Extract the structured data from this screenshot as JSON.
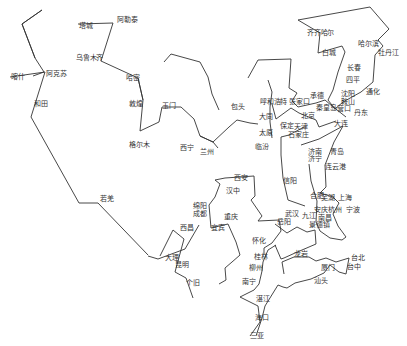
{
  "map": {
    "width": 407,
    "height": 346,
    "line_color": "#333333",
    "label_color": "#333333",
    "routes": [
      {
        "name": "xinjiang-west",
        "points": [
          [
            33,
            76
          ],
          [
            44,
            72
          ],
          [
            35,
            58
          ],
          [
            22,
            24
          ],
          [
            42,
            10
          ],
          [
            22,
            24
          ],
          [
            35,
            58
          ]
        ]
      },
      {
        "name": "tacheng-altay-urumqi",
        "points": [
          [
            78,
            24
          ],
          [
            113,
            23
          ],
          [
            101,
            61
          ],
          [
            138,
            78
          ],
          [
            143,
            100
          ]
        ]
      },
      {
        "name": "kashgar-hotan-lhasa",
        "points": [
          [
            10,
            77
          ],
          [
            45,
            72
          ],
          [
            31,
            117
          ],
          [
            79,
            203
          ],
          [
            98,
            203
          ],
          [
            148,
            255
          ]
        ]
      },
      {
        "name": "hami-golmud-xining",
        "points": [
          [
            138,
            78
          ],
          [
            143,
            100
          ],
          [
            140,
            131
          ],
          [
            159,
            122
          ],
          [
            162,
            107
          ],
          [
            181,
            107
          ],
          [
            194,
            119
          ],
          [
            200,
            136
          ],
          [
            213,
            142
          ],
          [
            229,
            127
          ],
          [
            237,
            120
          ],
          [
            250,
            123
          ],
          [
            258,
            124
          ]
        ]
      },
      {
        "name": "qinghai-gansu",
        "points": [
          [
            164,
            62
          ],
          [
            171,
            54
          ],
          [
            200,
            62
          ],
          [
            208,
            77
          ],
          [
            212,
            94
          ],
          [
            219,
            110
          ]
        ]
      },
      {
        "name": "northeast-loop",
        "points": [
          [
            298,
            20
          ],
          [
            370,
            7
          ],
          [
            389,
            29
          ],
          [
            378,
            40
          ],
          [
            383,
            46
          ],
          [
            375,
            55
          ],
          [
            373,
            82
          ],
          [
            361,
            92
          ],
          [
            343,
            102
          ],
          [
            335,
            109
          ],
          [
            328,
            100
          ],
          [
            333,
            90
          ],
          [
            338,
            72
          ],
          [
            345,
            52
          ],
          [
            342,
            46
          ],
          [
            318,
            53
          ],
          [
            320,
            33
          ],
          [
            298,
            20
          ]
        ]
      },
      {
        "name": "hohhot-north-china",
        "points": [
          [
            248,
            78
          ],
          [
            258,
            60
          ],
          [
            291,
            59
          ],
          [
            289,
            88
          ],
          [
            297,
            93
          ],
          [
            292,
            101
          ],
          [
            298,
            107
          ],
          [
            316,
            103
          ],
          [
            325,
            100
          ],
          [
            332,
            106
          ],
          [
            346,
            117
          ]
        ]
      },
      {
        "name": "beijing-tianjin-coast",
        "points": [
          [
            272,
            104
          ],
          [
            276,
            119
          ],
          [
            291,
            108
          ],
          [
            299,
            113
          ],
          [
            316,
            120
          ],
          [
            319,
            127
          ],
          [
            336,
            121
          ]
        ]
      },
      {
        "name": "datong-taiyuan",
        "points": [
          [
            268,
            80
          ],
          [
            272,
            92
          ],
          [
            270,
            107
          ],
          [
            270,
            122
          ],
          [
            272,
            138
          ]
        ]
      },
      {
        "name": "shijiazhuang-xinyang",
        "points": [
          [
            304,
            127
          ],
          [
            289,
            135
          ],
          [
            281,
            137
          ],
          [
            281,
            155
          ],
          [
            283,
            178
          ],
          [
            288,
            200
          ],
          [
            305,
            206
          ]
        ]
      },
      {
        "name": "shandong-loop",
        "points": [
          [
            301,
            145
          ],
          [
            319,
            139
          ],
          [
            343,
            126
          ],
          [
            334,
            142
          ],
          [
            325,
            165
          ],
          [
            326,
            187
          ],
          [
            320,
            193
          ],
          [
            333,
            197
          ],
          [
            339,
            203
          ],
          [
            333,
            214
          ],
          [
            338,
            226
          ],
          [
            346,
            237
          ],
          [
            342,
            240
          ],
          [
            330,
            238
          ],
          [
            320,
            231
          ],
          [
            316,
            222
          ],
          [
            317,
            201
          ],
          [
            311,
            181
          ],
          [
            309,
            164
          ]
        ]
      },
      {
        "name": "xian-chengdu-yibin",
        "points": [
          [
            215,
            180
          ],
          [
            225,
            178
          ],
          [
            254,
            176
          ],
          [
            255,
            196
          ],
          [
            251,
            200
          ],
          [
            262,
            216
          ],
          [
            258,
            221
          ],
          [
            279,
            220
          ],
          [
            281,
            231
          ],
          [
            272,
            243
          ],
          [
            264,
            248
          ],
          [
            264,
            255
          ]
        ]
      },
      {
        "name": "hanzhong-chengdu",
        "points": [
          [
            215,
            180
          ],
          [
            220,
            184
          ],
          [
            215,
            197
          ],
          [
            209,
            205
          ],
          [
            211,
            228
          ],
          [
            228,
            224
          ],
          [
            236,
            242
          ],
          [
            240,
            255
          ],
          [
            232,
            262
          ],
          [
            225,
            268
          ],
          [
            226,
            280
          ],
          [
            219,
            284
          ]
        ]
      },
      {
        "name": "lanzhou-xian",
        "points": [
          [
            200,
            136
          ],
          [
            213,
            142
          ],
          [
            218,
            148
          ]
        ]
      },
      {
        "name": "chengdu-kunming",
        "points": [
          [
            199,
            225
          ],
          [
            185,
            249
          ],
          [
            158,
            259
          ],
          [
            148,
            256
          ]
        ]
      },
      {
        "name": "kunming-gejiu",
        "points": [
          [
            160,
            256
          ],
          [
            173,
            230
          ],
          [
            184,
            239
          ],
          [
            175,
            272
          ],
          [
            186,
            278
          ],
          [
            193,
            298
          ]
        ]
      },
      {
        "name": "huaihua-nanning",
        "points": [
          [
            276,
            245
          ],
          [
            268,
            250
          ],
          [
            263,
            262
          ],
          [
            262,
            271
          ],
          [
            259,
            284
          ],
          [
            254,
            290
          ],
          [
            240,
            297
          ],
          [
            258,
            306
          ],
          [
            260,
            322
          ],
          [
            250,
            336
          ]
        ]
      },
      {
        "name": "south-coast",
        "points": [
          [
            284,
            274
          ],
          [
            282,
            262
          ],
          [
            294,
            257
          ],
          [
            309,
            257
          ],
          [
            316,
            261
          ],
          [
            326,
            258
          ],
          [
            336,
            262
          ],
          [
            349,
            258
          ],
          [
            346,
            274
          ],
          [
            339,
            272
          ],
          [
            330,
            265
          ],
          [
            324,
            273
          ],
          [
            311,
            279
          ],
          [
            295,
            283
          ],
          [
            287,
            288
          ],
          [
            283,
            287
          ],
          [
            278,
            285
          ],
          [
            265,
            306
          ],
          [
            262,
            318
          ],
          [
            256,
            336
          ]
        ]
      },
      {
        "name": "hubei-jiangxi",
        "points": [
          [
            275,
            224
          ],
          [
            287,
            233
          ],
          [
            297,
            227
          ],
          [
            307,
            232
          ],
          [
            315,
            230
          ],
          [
            316,
            244
          ],
          [
            295,
            253
          ],
          [
            284,
            258
          ],
          [
            281,
            259
          ],
          [
            275,
            245
          ]
        ]
      }
    ],
    "labels": [
      {
        "text": "阿勒泰",
        "x": 117,
        "y": 20
      },
      {
        "text": "塔城",
        "x": 79,
        "y": 26
      },
      {
        "text": "乌鲁木齐",
        "x": 76,
        "y": 58
      },
      {
        "text": "哈密",
        "x": 126,
        "y": 78
      },
      {
        "text": "阿克苏",
        "x": 46,
        "y": 74
      },
      {
        "text": "喀什",
        "x": 11,
        "y": 77
      },
      {
        "text": "和田",
        "x": 34,
        "y": 104
      },
      {
        "text": "敦煌",
        "x": 129,
        "y": 104
      },
      {
        "text": "玉门",
        "x": 162,
        "y": 106
      },
      {
        "text": "格尔木",
        "x": 129,
        "y": 145
      },
      {
        "text": "西宁",
        "x": 180,
        "y": 148
      },
      {
        "text": "兰州",
        "x": 200,
        "y": 152
      },
      {
        "text": "若羌",
        "x": 100,
        "y": 199
      },
      {
        "text": "齐齐哈尔",
        "x": 307,
        "y": 33
      },
      {
        "text": "哈尔滨",
        "x": 358,
        "y": 44
      },
      {
        "text": "白城",
        "x": 322,
        "y": 53
      },
      {
        "text": "牡丹江",
        "x": 378,
        "y": 53
      },
      {
        "text": "长春",
        "x": 347,
        "y": 68
      },
      {
        "text": "四平",
        "x": 346,
        "y": 80
      },
      {
        "text": "通化",
        "x": 366,
        "y": 92
      },
      {
        "text": "包头",
        "x": 231,
        "y": 107
      },
      {
        "text": "呼和浩特",
        "x": 260,
        "y": 102
      },
      {
        "text": "张家口",
        "x": 289,
        "y": 102
      },
      {
        "text": "承德",
        "x": 310,
        "y": 96
      },
      {
        "text": "沈阳",
        "x": 341,
        "y": 94
      },
      {
        "text": "鞍山",
        "x": 341,
        "y": 102
      },
      {
        "text": "营口",
        "x": 337,
        "y": 109
      },
      {
        "text": "丹东",
        "x": 354,
        "y": 113
      },
      {
        "text": "秦皇岛",
        "x": 316,
        "y": 108
      },
      {
        "text": "大同",
        "x": 259,
        "y": 117
      },
      {
        "text": "北京",
        "x": 301,
        "y": 116
      },
      {
        "text": "大连",
        "x": 334,
        "y": 124
      },
      {
        "text": "保定",
        "x": 280,
        "y": 126
      },
      {
        "text": "天津",
        "x": 294,
        "y": 127
      },
      {
        "text": "太原",
        "x": 259,
        "y": 133
      },
      {
        "text": "石家庄",
        "x": 288,
        "y": 135
      },
      {
        "text": "临汾",
        "x": 255,
        "y": 147
      },
      {
        "text": "济南",
        "x": 308,
        "y": 152
      },
      {
        "text": "济宁",
        "x": 308,
        "y": 159
      },
      {
        "text": "青岛",
        "x": 330,
        "y": 152
      },
      {
        "text": "连云港",
        "x": 325,
        "y": 167
      },
      {
        "text": "西安",
        "x": 234,
        "y": 178
      },
      {
        "text": "信阳",
        "x": 283,
        "y": 181
      },
      {
        "text": "汉中",
        "x": 226,
        "y": 191
      },
      {
        "text": "合肥",
        "x": 310,
        "y": 196
      },
      {
        "text": "芜湖",
        "x": 321,
        "y": 198
      },
      {
        "text": "上海",
        "x": 338,
        "y": 198
      },
      {
        "text": "绵阳",
        "x": 193,
        "y": 206
      },
      {
        "text": "安庆",
        "x": 314,
        "y": 210
      },
      {
        "text": "杭州",
        "x": 328,
        "y": 210
      },
      {
        "text": "宁波",
        "x": 346,
        "y": 210
      },
      {
        "text": "成都",
        "x": 193,
        "y": 214
      },
      {
        "text": "武汉",
        "x": 285,
        "y": 214
      },
      {
        "text": "九江",
        "x": 302,
        "y": 216
      },
      {
        "text": "南昌",
        "x": 318,
        "y": 218
      },
      {
        "text": "重庆",
        "x": 224,
        "y": 217
      },
      {
        "text": "岳阳",
        "x": 277,
        "y": 222
      },
      {
        "text": "景德镇",
        "x": 309,
        "y": 225
      },
      {
        "text": "宜宾",
        "x": 211,
        "y": 228
      },
      {
        "text": "西昌",
        "x": 180,
        "y": 228
      },
      {
        "text": "怀化",
        "x": 252,
        "y": 241
      },
      {
        "text": "大理",
        "x": 165,
        "y": 258
      },
      {
        "text": "昆明",
        "x": 175,
        "y": 265
      },
      {
        "text": "桂林",
        "x": 254,
        "y": 257
      },
      {
        "text": "龙岩",
        "x": 294,
        "y": 254
      },
      {
        "text": "台北",
        "x": 351,
        "y": 258
      },
      {
        "text": "柳州",
        "x": 249,
        "y": 268
      },
      {
        "text": "台中",
        "x": 347,
        "y": 267
      },
      {
        "text": "厦门",
        "x": 321,
        "y": 268
      },
      {
        "text": "南宁",
        "x": 242,
        "y": 282
      },
      {
        "text": "汕头",
        "x": 314,
        "y": 281
      },
      {
        "text": "个旧",
        "x": 186,
        "y": 283
      },
      {
        "text": "湛江",
        "x": 256,
        "y": 299
      },
      {
        "text": "海口",
        "x": 255,
        "y": 318
      },
      {
        "text": "三亚",
        "x": 250,
        "y": 336
      }
    ]
  }
}
